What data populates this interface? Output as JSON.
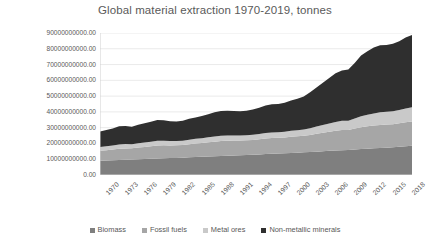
{
  "chart_data": {
    "type": "area",
    "title": "Global material extraction 1970-2019, tonnes",
    "xlabel": "",
    "ylabel": "",
    "stacked": true,
    "grid": true,
    "legend_position": "bottom",
    "ylim": [
      0,
      90000000000
    ],
    "ytick_values": [
      0,
      10000000000,
      20000000000,
      30000000000,
      40000000000,
      50000000000,
      60000000000,
      70000000000,
      80000000000,
      90000000000
    ],
    "ytick_labels": [
      "0.00",
      "10000000000.00",
      "20000000000.00",
      "30000000000.00",
      "40000000000.00",
      "50000000000.00",
      "60000000000.00",
      "70000000000.00",
      "80000000000.00",
      "90000000000.00"
    ],
    "xlim": [
      1970,
      2019
    ],
    "xtick_labels": [
      "1970",
      "1973",
      "1976",
      "1979",
      "1982",
      "1985",
      "1988",
      "1991",
      "1994",
      "1997",
      "2000",
      "2003",
      "2006",
      "2009",
      "2012",
      "2015",
      "2018"
    ],
    "x": [
      1970,
      1971,
      1972,
      1973,
      1974,
      1975,
      1976,
      1977,
      1978,
      1979,
      1980,
      1981,
      1982,
      1983,
      1984,
      1985,
      1986,
      1987,
      1988,
      1989,
      1990,
      1991,
      1992,
      1993,
      1994,
      1995,
      1996,
      1997,
      1998,
      1999,
      2000,
      2001,
      2002,
      2003,
      2004,
      2005,
      2006,
      2007,
      2008,
      2009,
      2010,
      2011,
      2012,
      2013,
      2014,
      2015,
      2016,
      2017,
      2018,
      2019
    ],
    "series": [
      {
        "name": "Biomass",
        "color": "#7f7f7f",
        "values": [
          9100000000,
          9250000000,
          9400000000,
          9550000000,
          9700000000,
          9800000000,
          9950000000,
          10100000000,
          10300000000,
          10450000000,
          10600000000,
          10700000000,
          10850000000,
          11000000000,
          11200000000,
          11400000000,
          11600000000,
          11750000000,
          11950000000,
          12100000000,
          12250000000,
          12350000000,
          12500000000,
          12650000000,
          12850000000,
          13050000000,
          13300000000,
          13450000000,
          13600000000,
          13800000000,
          14000000000,
          14150000000,
          14350000000,
          14550000000,
          14800000000,
          15050000000,
          15300000000,
          15500000000,
          15750000000,
          15900000000,
          16150000000,
          16400000000,
          16650000000,
          16900000000,
          17150000000,
          17350000000,
          17600000000,
          17900000000,
          18200000000,
          18500000000
        ]
      },
      {
        "name": "Fossil fuels",
        "color": "#a6a6a6",
        "values": [
          6200000000,
          6500000000,
          6750000000,
          7100000000,
          7150000000,
          7100000000,
          7450000000,
          7700000000,
          7900000000,
          8250000000,
          8200000000,
          8050000000,
          7950000000,
          7950000000,
          8250000000,
          8500000000,
          8700000000,
          8950000000,
          9200000000,
          9400000000,
          9500000000,
          9450000000,
          9350000000,
          9300000000,
          9350000000,
          9550000000,
          9850000000,
          9950000000,
          9950000000,
          10000000000,
          10250000000,
          10350000000,
          10450000000,
          10850000000,
          11350000000,
          11800000000,
          12150000000,
          12550000000,
          12850000000,
          12650000000,
          13250000000,
          13900000000,
          14200000000,
          14450000000,
          14600000000,
          14600000000,
          14600000000,
          14850000000,
          15200000000,
          15400000000
        ]
      },
      {
        "name": "Metal ores",
        "color": "#c9c9c9",
        "values": [
          2400000000,
          2500000000,
          2600000000,
          2750000000,
          2750000000,
          2650000000,
          2800000000,
          2850000000,
          2900000000,
          3000000000,
          2950000000,
          2850000000,
          2750000000,
          2800000000,
          2950000000,
          3000000000,
          3050000000,
          3150000000,
          3250000000,
          3300000000,
          3300000000,
          3250000000,
          3200000000,
          3200000000,
          3250000000,
          3400000000,
          3500000000,
          3600000000,
          3600000000,
          3650000000,
          3800000000,
          3850000000,
          4000000000,
          4250000000,
          4550000000,
          4850000000,
          5200000000,
          5600000000,
          5850000000,
          5900000000,
          6450000000,
          6950000000,
          7300000000,
          7700000000,
          8000000000,
          8100000000,
          8200000000,
          8450000000,
          8800000000,
          9100000000
        ]
      },
      {
        "name": "Non-metallic minerals",
        "color": "#2f2f2f",
        "values": [
          9800000000,
          10300000000,
          10800000000,
          11500000000,
          11400000000,
          11100000000,
          11700000000,
          12200000000,
          12700000000,
          13200000000,
          12900000000,
          12500000000,
          12300000000,
          12700000000,
          13300000000,
          13600000000,
          14100000000,
          14700000000,
          15300000000,
          15700000000,
          15700000000,
          15500000000,
          15400000000,
          15600000000,
          16100000000,
          16700000000,
          17400000000,
          17800000000,
          17900000000,
          18400000000,
          19200000000,
          19900000000,
          21000000000,
          22800000000,
          24800000000,
          26800000000,
          28900000000,
          30900000000,
          31800000000,
          32400000000,
          35200000000,
          38500000000,
          40300000000,
          41800000000,
          42500000000,
          42400000000,
          42800000000,
          43600000000,
          44900000000,
          45700000000
        ]
      }
    ]
  },
  "legend": {
    "items": [
      {
        "label": "Biomass",
        "color": "#7f7f7f"
      },
      {
        "label": "Fossil fuels",
        "color": "#a6a6a6"
      },
      {
        "label": "Metal ores",
        "color": "#c9c9c9"
      },
      {
        "label": "Non-metallic minerals",
        "color": "#2f2f2f"
      }
    ]
  },
  "axis": {
    "gridline_color": "#e4e4e4",
    "axis_line_color": "#d0d0d0",
    "tick_text_color": "#595959"
  }
}
